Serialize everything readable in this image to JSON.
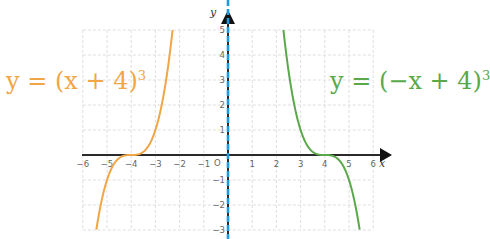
{
  "chart_data": {
    "type": "line",
    "title": "",
    "xlabel": "x",
    "ylabel": "y",
    "origin_label": "O",
    "xlim": [
      -6,
      6
    ],
    "ylim": [
      -3,
      5
    ],
    "grid": true,
    "x_ticks": [
      -6,
      -5,
      -4,
      -3,
      -2,
      -1,
      1,
      2,
      3,
      4,
      5,
      6
    ],
    "y_ticks": [
      -3,
      -2,
      -1,
      1,
      2,
      3,
      4,
      5
    ],
    "x_tick_labels": [
      "−6",
      "−5",
      "−4",
      "−3",
      "−2",
      "−1",
      "1",
      "2",
      "3",
      "4",
      "5",
      "6"
    ],
    "y_tick_labels": [
      "−3",
      "−2",
      "−1",
      "1",
      "2",
      "3",
      "4",
      "5"
    ],
    "series": [
      {
        "name": "y = (x + 4)^3",
        "label": "y = (x + 4)",
        "exponent": "3",
        "color": "#f0a646",
        "formula": "(x+4)^3",
        "x": [
          -5.44,
          -5,
          -4.5,
          -4,
          -3.5,
          -3,
          -2.29
        ],
        "y": [
          -3,
          -1,
          -0.125,
          0,
          0.125,
          1,
          5
        ]
      },
      {
        "name": "y = (−x + 4)^3",
        "label": "y = (−x + 4)",
        "exponent": "3",
        "color": "#5aa84a",
        "formula": "(-x+4)^3",
        "x": [
          2.29,
          3,
          3.5,
          4,
          4.5,
          5,
          5.44
        ],
        "y": [
          5,
          1,
          0.125,
          0,
          -0.125,
          -1,
          -3
        ]
      }
    ],
    "annotations": [
      {
        "text": "axis of symmetry (y-axis)",
        "style": "blue dashed vertical line at x = 0",
        "color": "#1e9be0"
      }
    ]
  }
}
